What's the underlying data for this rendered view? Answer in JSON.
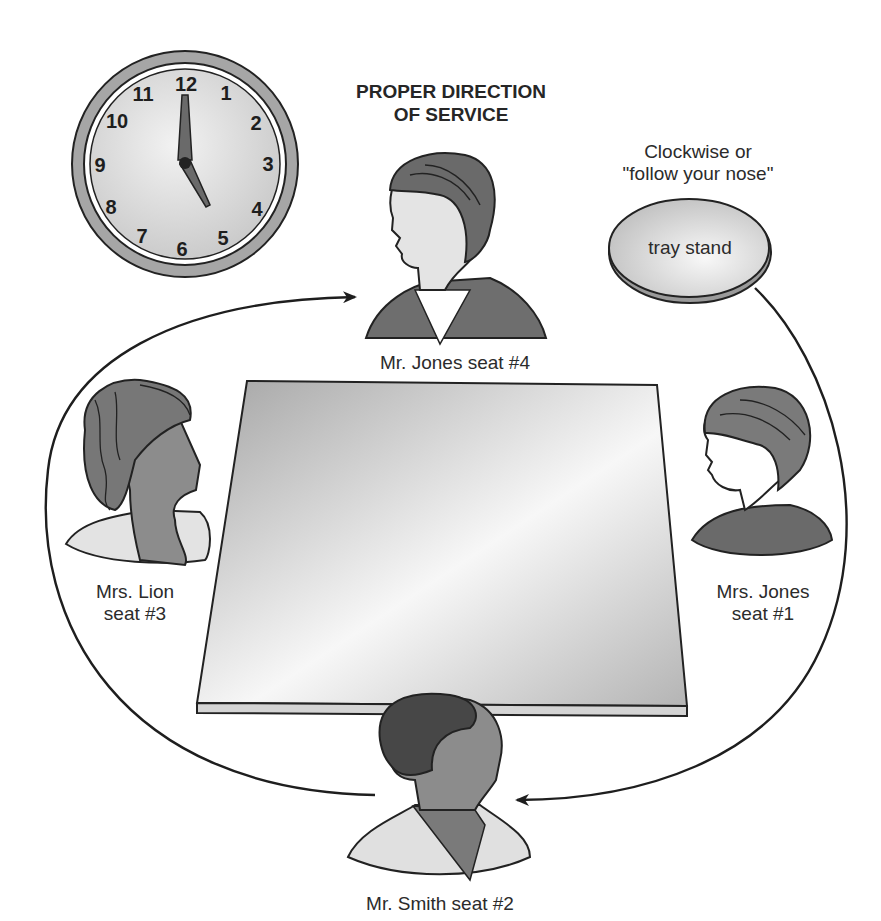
{
  "title": {
    "line1": "PROPER DIRECTION",
    "line2": "OF SERVICE"
  },
  "direction_note": {
    "line1": "Clockwise or",
    "line2": "\"follow your nose\""
  },
  "tray_stand": {
    "label": "tray stand"
  },
  "clock": {
    "numerals": [
      "12",
      "1",
      "2",
      "3",
      "4",
      "5",
      "6",
      "7",
      "8",
      "9",
      "10",
      "11"
    ],
    "time_shown": "5:00",
    "colors": {
      "rim": "#a8a8a8",
      "face": "#dcdcdc",
      "hands": "#555555"
    }
  },
  "table": {
    "colors": {
      "top_dark": "#a9a9a9",
      "top_light": "#f4f4f4",
      "edge": "#cfcfcf"
    }
  },
  "seats": [
    {
      "id": "mr-jones",
      "name": "Mr. Jones",
      "seat": "seat #4",
      "label": "Mr. Jones seat #4"
    },
    {
      "id": "mrs-lion",
      "name": "Mrs. Lion",
      "seat": "seat #3"
    },
    {
      "id": "mrs-jones",
      "name": "Mrs. Jones",
      "seat": "seat #1"
    },
    {
      "id": "mr-smith",
      "name": "Mr. Smith",
      "seat": "seat #2",
      "label": "Mr. Smith seat #2"
    }
  ],
  "service_order": [
    "Mrs. Jones seat #1",
    "Mr. Smith seat #2",
    "Mrs. Lion seat #3",
    "Mr. Jones seat #4"
  ],
  "colors": {
    "line": "#1e1e1e",
    "hair_dark": "#4a4a4a",
    "hair_mid": "#7d7d7d",
    "skin_light": "#e6e6e6",
    "skin_dark": "#8a8a8a",
    "jacket": "#6f6f6f"
  }
}
